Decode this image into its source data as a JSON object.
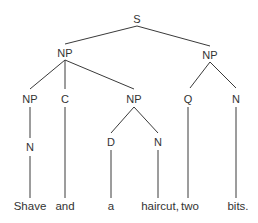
{
  "diagram": {
    "type": "syntax-tree",
    "line_color": "#3a3a3a",
    "nodes": [
      {
        "id": "s",
        "label": "S",
        "x": 137,
        "y": 19
      },
      {
        "id": "np1",
        "label": "NP",
        "x": 65,
        "y": 53
      },
      {
        "id": "np2",
        "label": "NP",
        "x": 210,
        "y": 55
      },
      {
        "id": "np3",
        "label": "NP",
        "x": 30,
        "y": 99
      },
      {
        "id": "c",
        "label": "C",
        "x": 65,
        "y": 99
      },
      {
        "id": "np4",
        "label": "NP",
        "x": 134,
        "y": 99
      },
      {
        "id": "q",
        "label": "Q",
        "x": 188,
        "y": 99
      },
      {
        "id": "n1",
        "label": "N",
        "x": 236,
        "y": 99
      },
      {
        "id": "n2",
        "label": "N",
        "x": 30,
        "y": 147
      },
      {
        "id": "d",
        "label": "D",
        "x": 111,
        "y": 142
      },
      {
        "id": "n3",
        "label": "N",
        "x": 158,
        "y": 142
      }
    ],
    "words": [
      {
        "id": "w1",
        "label": "Shave",
        "x": 30,
        "y": 206
      },
      {
        "id": "w2",
        "label": "and",
        "x": 65,
        "y": 206
      },
      {
        "id": "w3",
        "label": "a",
        "x": 111,
        "y": 206
      },
      {
        "id": "w4",
        "label": "haircut,",
        "x": 158,
        "y": 206
      },
      {
        "id": "w5",
        "label": "two",
        "x": 190,
        "y": 206
      },
      {
        "id": "w6",
        "label": "bits.",
        "x": 236,
        "y": 206
      }
    ],
    "sentence": "Shave and a haircut, two bits."
  }
}
